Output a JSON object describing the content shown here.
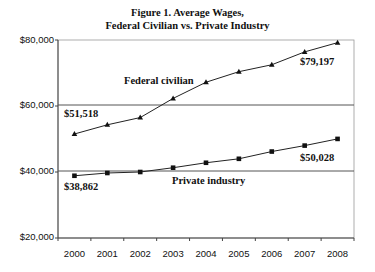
{
  "chart_data": {
    "type": "line",
    "title": "Figure 1. Average Wages,",
    "subtitle": "Federal Civilian vs. Private Industry",
    "xlabel": "",
    "ylabel": "",
    "ylim": [
      20000,
      80000
    ],
    "yticks": [
      "$20,000",
      "$40,000",
      "$60,000",
      "$80,000"
    ],
    "grid": "horizontal at $40,000 and $60,000",
    "legend": "none (inline labels)",
    "categories": [
      "2000",
      "2001",
      "2002",
      "2003",
      "2004",
      "2005",
      "2006",
      "2007",
      "2008"
    ],
    "series": [
      {
        "name": "Federal civilian",
        "marker": "triangle",
        "values": [
          51518,
          54300,
          56500,
          62300,
          67200,
          70400,
          72500,
          76400,
          79197
        ]
      },
      {
        "name": "Private industry",
        "marker": "square",
        "values": [
          38862,
          39700,
          40000,
          41300,
          42800,
          44000,
          46200,
          48000,
          50028
        ]
      }
    ],
    "annotations": [
      "$51,518",
      "$79,197",
      "$38,862",
      "$50,028",
      "Federal civilian",
      "Private industry"
    ]
  },
  "labels": {
    "title_line1": "Figure 1. Average Wages,",
    "title_line2": "Federal Civilian vs. Private Industry",
    "y80": "$80,000",
    "y60": "$60,000",
    "y40": "$40,000",
    "y20": "$20,000",
    "federal_name": "Federal civilian",
    "private_name": "Private industry",
    "federal_start": "$51,518",
    "federal_end": "$79,197",
    "private_start": "$38,862",
    "private_end": "$50,028",
    "x": [
      "2000",
      "2001",
      "2002",
      "2003",
      "2004",
      "2005",
      "2006",
      "2007",
      "2008"
    ]
  }
}
